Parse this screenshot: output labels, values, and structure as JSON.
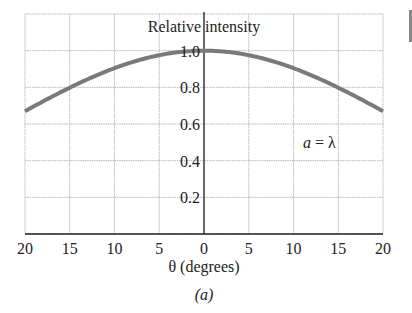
{
  "chart_data": {
    "type": "line",
    "title": "Relative intensity",
    "xlabel": "θ (degrees)",
    "ylabel": "Relative intensity",
    "caption": "(a)",
    "annotation": "a = λ",
    "x_tick_labels": [
      "20",
      "15",
      "10",
      "5",
      "0",
      "5",
      "10",
      "15",
      "20"
    ],
    "x_ticks": [
      -20,
      -15,
      -10,
      -5,
      0,
      5,
      10,
      15,
      20
    ],
    "y_tick_labels": [
      "0.2",
      "0.4",
      "0.6",
      "0.8",
      "1.0"
    ],
    "y_ticks": [
      0.2,
      0.4,
      0.6,
      0.8,
      1.0
    ],
    "xlim": [
      -20,
      20
    ],
    "ylim": [
      0,
      1.2
    ],
    "grid": true,
    "legend": null,
    "series": [
      {
        "name": "a = λ",
        "color": "#7a7a7a",
        "x": [
          -20,
          -17.5,
          -15,
          -12.5,
          -10,
          -7.5,
          -5,
          -2.5,
          0,
          2.5,
          5,
          7.5,
          10,
          12.5,
          15,
          17.5,
          20
        ],
        "values": [
          0.67,
          0.74,
          0.8,
          0.86,
          0.91,
          0.95,
          0.98,
          0.99,
          1.0,
          0.99,
          0.98,
          0.95,
          0.91,
          0.86,
          0.8,
          0.74,
          0.67
        ]
      }
    ]
  },
  "labels": {
    "title": "Relative intensity",
    "xlabel": "θ (degrees)",
    "caption": "(a)",
    "annotation_a": "a",
    "annotation_eq": " = λ"
  }
}
